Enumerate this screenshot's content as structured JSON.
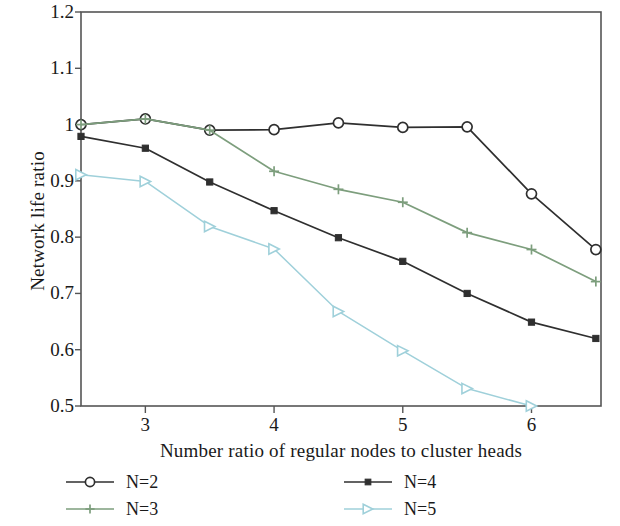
{
  "chart_data": {
    "type": "line",
    "title": "",
    "xlabel": "Number ratio of regular nodes to cluster heads",
    "ylabel": "Network life ratio",
    "xlim": [
      2.5,
      6.54
    ],
    "ylim": [
      0.5,
      1.2
    ],
    "xticks": [
      3,
      4,
      5,
      6
    ],
    "xtick_labels": [
      "3",
      "4",
      "5",
      "6"
    ],
    "yticks": [
      0.5,
      0.6,
      0.7,
      0.8,
      0.9,
      1.0,
      1.1,
      1.2
    ],
    "ytick_labels": [
      "0.5",
      "0.6",
      "0.7",
      "0.8",
      "0.9",
      "1",
      "1.1",
      "1.2"
    ],
    "grid": false,
    "legend_position": "below",
    "x": [
      2.5,
      3.0,
      3.5,
      4.0,
      4.5,
      5.0,
      5.5,
      6.0,
      6.5
    ],
    "series": [
      {
        "name": "N=2",
        "color": "#2f2f2f",
        "marker": "open-circle",
        "values": [
          1.0,
          1.01,
          0.99,
          0.991,
          1.003,
          0.995,
          0.996,
          0.877,
          0.778
        ]
      },
      {
        "name": "N=3",
        "color": "#7d9e7d",
        "marker": "plus",
        "values": [
          1.0,
          1.01,
          0.99,
          0.917,
          0.885,
          0.862,
          0.808,
          0.778,
          0.721
        ]
      },
      {
        "name": "N=4",
        "color": "#2f2f2f",
        "marker": "filled-square",
        "values": [
          0.979,
          0.958,
          0.898,
          0.847,
          0.799,
          0.757,
          0.7,
          0.649,
          0.62
        ]
      },
      {
        "name": "N=5",
        "color": "#9fd0da",
        "marker": "right-triangle",
        "values": [
          0.911,
          0.899,
          0.819,
          0.779,
          0.668,
          0.598,
          0.531,
          0.5,
          null
        ]
      }
    ]
  },
  "legend": {
    "entries": [
      {
        "label": "N=2",
        "series_index": 0
      },
      {
        "label": "N=3",
        "series_index": 1
      },
      {
        "label": "N=4",
        "series_index": 2
      },
      {
        "label": "N=5",
        "series_index": 3
      }
    ]
  },
  "colors": {
    "axis": "#555555",
    "text": "#1a1a1a",
    "background": "#ffffff",
    "series_black": "#2f2f2f",
    "series_green": "#7d9e7d",
    "series_blue": "#9fd0da"
  }
}
